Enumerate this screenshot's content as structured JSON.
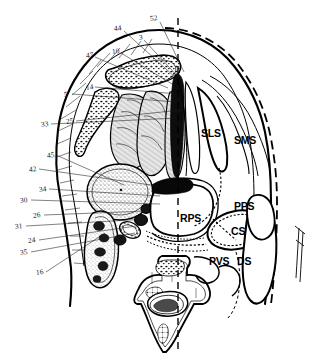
{
  "figure": {
    "type": "anatomical-cross-section",
    "region": "suprahyoid neck axial section",
    "background_color": "#ffffff",
    "ink_color": "#000000",
    "midline": {
      "name": "sagittal midline",
      "style": "dashed vertical"
    }
  },
  "numeric_labels": [
    {
      "id": "52",
      "text": "52",
      "x": 150,
      "y": 15,
      "leader_to_x": 184,
      "leader_to_y": 72
    },
    {
      "id": "44",
      "text": "44",
      "x": 114,
      "y": 25,
      "leader_to_x": 176,
      "leader_to_y": 76
    },
    {
      "id": "3",
      "text": "3",
      "x": 139,
      "y": 34,
      "leader_to_x": 180,
      "leader_to_y": 78
    },
    {
      "id": "10",
      "text": "10",
      "x": 112,
      "y": 48,
      "leader_to_x": 172,
      "leader_to_y": 82
    },
    {
      "id": "47",
      "text": "47",
      "x": 86,
      "y": 52,
      "leader_to_x": 168,
      "leader_to_y": 86
    },
    {
      "id": "14",
      "text": "14",
      "x": 86,
      "y": 84,
      "leader_to_x": 178,
      "leader_to_y": 92
    },
    {
      "id": "5",
      "text": "5",
      "x": 64,
      "y": 91,
      "leader_to_x": 176,
      "leader_to_y": 100
    },
    {
      "id": "25",
      "text": "25",
      "x": 66,
      "y": 118,
      "leader_to_x": 180,
      "leader_to_y": 108
    },
    {
      "id": "33",
      "text": "33",
      "x": 41,
      "y": 121,
      "leader_to_x": 176,
      "leader_to_y": 116
    },
    {
      "id": "45",
      "text": "45",
      "x": 47,
      "y": 152,
      "leader_to_x": 126,
      "leader_to_y": 183
    },
    {
      "id": "42",
      "text": "42",
      "x": 29,
      "y": 166,
      "leader_to_x": 158,
      "leader_to_y": 184
    },
    {
      "id": "34",
      "text": "34",
      "x": 39,
      "y": 186,
      "leader_to_x": 160,
      "leader_to_y": 194
    },
    {
      "id": "30",
      "text": "30",
      "x": 20,
      "y": 197,
      "leader_to_x": 160,
      "leader_to_y": 202
    },
    {
      "id": "26",
      "text": "26",
      "x": 33,
      "y": 212,
      "leader_to_x": 145,
      "leader_to_y": 210
    },
    {
      "id": "31",
      "text": "31",
      "x": 15,
      "y": 223,
      "leader_to_x": 146,
      "leader_to_y": 218
    },
    {
      "id": "24",
      "text": "24",
      "x": 28,
      "y": 237,
      "leader_to_x": 142,
      "leader_to_y": 224
    },
    {
      "id": "35",
      "text": "35",
      "x": 20,
      "y": 249,
      "leader_to_x": 134,
      "leader_to_y": 232
    },
    {
      "id": "16",
      "text": "16",
      "x": 36,
      "y": 269,
      "leader_to_x": 104,
      "leader_to_y": 232
    }
  ],
  "acronym_labels": [
    {
      "id": "SLS",
      "text": "SLS",
      "x": 201,
      "y": 128,
      "meaning": "sublingual space"
    },
    {
      "id": "SMS",
      "text": "SMS",
      "x": 234,
      "y": 135,
      "meaning": "submandibular space"
    },
    {
      "id": "RPS",
      "text": "RPS",
      "x": 180,
      "y": 213,
      "meaning": "retropharyngeal space"
    },
    {
      "id": "PPS",
      "text": "PPS",
      "x": 234,
      "y": 201,
      "meaning": "parapharyngeal space"
    },
    {
      "id": "CS",
      "text": "CS",
      "x": 231,
      "y": 226,
      "meaning": "carotid space"
    },
    {
      "id": "PVS",
      "text": "PVS",
      "x": 209,
      "y": 256,
      "meaning": "prevertebral space"
    },
    {
      "id": "DS",
      "text": "DS",
      "x": 237,
      "y": 256,
      "meaning": "danger space"
    }
  ]
}
